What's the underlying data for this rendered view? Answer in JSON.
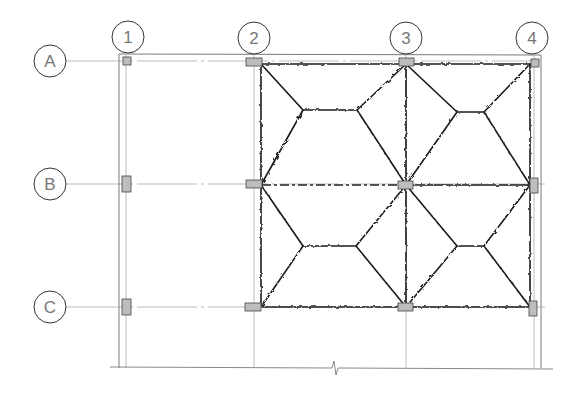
{
  "drawing": {
    "type": "structural-floor-plan",
    "description": "Grid plan with columns and yield-line pattern on two-way slab panels"
  },
  "grid": {
    "columns": [
      {
        "label": "1",
        "x": 126,
        "bubble_x": 128
      },
      {
        "label": "2",
        "x": 254,
        "bubble_x": 254
      },
      {
        "label": "3",
        "x": 406,
        "bubble_x": 406
      },
      {
        "label": "4",
        "x": 534,
        "bubble_x": 532
      }
    ],
    "rows": [
      {
        "label": "A",
        "y": 61
      },
      {
        "label": "B",
        "y": 185
      },
      {
        "label": "C",
        "y": 307
      }
    ]
  },
  "colors": {
    "grid_line": "#b8b8b8",
    "frame_line": "#777777",
    "yield_line": "#1a1a1a",
    "column_fill": "#bdbdbd",
    "column_stroke": "#444444",
    "bubble_stroke": "#333333",
    "bubble_text": "#777777"
  },
  "break_symbol": {
    "x": 335,
    "y": 368
  }
}
